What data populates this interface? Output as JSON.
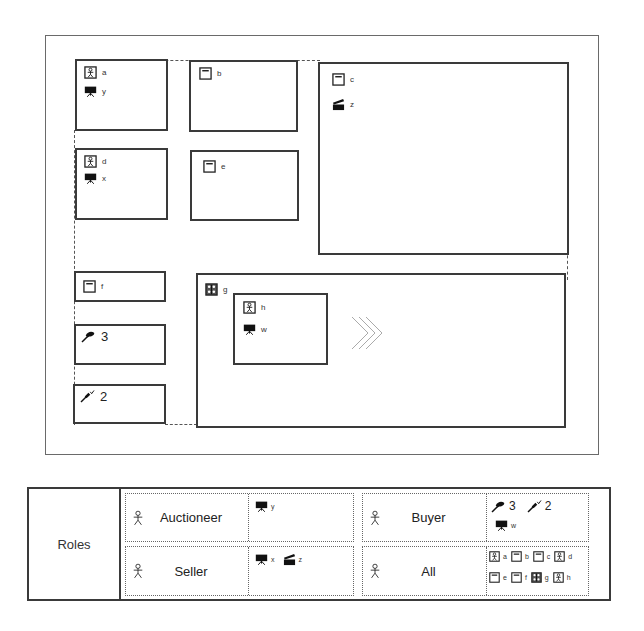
{
  "diagram": {
    "boxes": [
      {
        "id": "a-y",
        "items": [
          {
            "icon": "person-window-icon",
            "label": "a"
          },
          {
            "icon": "video-camera-icon",
            "label": "y"
          }
        ]
      },
      {
        "id": "b",
        "items": [
          {
            "icon": "window-icon",
            "label": "b"
          }
        ]
      },
      {
        "id": "c-z",
        "items": [
          {
            "icon": "window-icon",
            "label": "c"
          },
          {
            "icon": "clapperboard-icon",
            "label": "z"
          }
        ]
      },
      {
        "id": "d-x",
        "items": [
          {
            "icon": "person-window-icon",
            "label": "d"
          },
          {
            "icon": "video-camera-icon",
            "label": "x"
          }
        ]
      },
      {
        "id": "e",
        "items": [
          {
            "icon": "window-icon",
            "label": "e"
          }
        ]
      },
      {
        "id": "f",
        "items": [
          {
            "icon": "window-icon",
            "label": "f"
          }
        ]
      },
      {
        "id": "bid-3",
        "items": [
          {
            "icon": "gavel-hand-icon",
            "label": "3"
          }
        ]
      },
      {
        "id": "bid-2",
        "items": [
          {
            "icon": "gavel-check-icon",
            "label": "2"
          }
        ]
      },
      {
        "id": "g",
        "items": [
          {
            "icon": "group-window-icon",
            "label": "g"
          }
        ]
      },
      {
        "id": "h-w",
        "items": [
          {
            "icon": "person-window-icon",
            "label": "h"
          },
          {
            "icon": "video-camera-icon",
            "label": "w"
          }
        ]
      }
    ],
    "navigation_glyph": "chevrons-right-icon"
  },
  "roles_table": {
    "header": "Roles",
    "roles": [
      {
        "name": "Auctioneer",
        "grants": [
          {
            "icon": "video-camera-icon",
            "label": "y"
          }
        ]
      },
      {
        "name": "Buyer",
        "grants": [
          {
            "icon": "gavel-hand-icon",
            "label": "3"
          },
          {
            "icon": "gavel-check-icon",
            "label": "2"
          },
          {
            "icon": "video-camera-icon",
            "label": "w"
          }
        ]
      },
      {
        "name": "Seller",
        "grants": [
          {
            "icon": "video-camera-icon",
            "label": "x"
          },
          {
            "icon": "clapperboard-icon",
            "label": "z"
          }
        ]
      },
      {
        "name": "All",
        "grants": [
          {
            "icon": "person-window-icon",
            "label": "a"
          },
          {
            "icon": "window-icon",
            "label": "b"
          },
          {
            "icon": "window-icon",
            "label": "c"
          },
          {
            "icon": "person-window-icon",
            "label": "d"
          },
          {
            "icon": "window-icon",
            "label": "e"
          },
          {
            "icon": "window-icon",
            "label": "f"
          },
          {
            "icon": "group-window-icon",
            "label": "g"
          },
          {
            "icon": "person-window-icon",
            "label": "h"
          }
        ]
      }
    ]
  }
}
